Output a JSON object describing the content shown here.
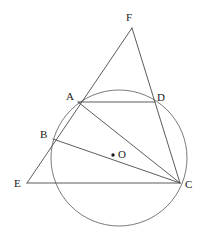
{
  "figure": {
    "type": "euclidean-geometry-diagram",
    "background_color": "#ffffff",
    "stroke_color": "#4a4a4a",
    "label_color": "#1a1a1a",
    "canvas": {
      "width": 201,
      "height": 238
    }
  },
  "circle": {
    "name": "circumscribed-circle",
    "center": {
      "x": 119,
      "y": 158
    },
    "radius": 68,
    "stroke": "#6b6b6b",
    "stroke_width": 0.9,
    "fill": "none"
  },
  "points": [
    {
      "id": "A",
      "label": "A",
      "x": 78,
      "y": 102,
      "label_x": 66,
      "label_y": 91,
      "on_circle": true,
      "dot": false
    },
    {
      "id": "B",
      "label": "B",
      "x": 53,
      "y": 139,
      "label_x": 40,
      "label_y": 129,
      "on_circle": true,
      "dot": false
    },
    {
      "id": "C",
      "label": "C",
      "x": 180,
      "y": 183,
      "label_x": 185,
      "label_y": 179,
      "on_circle": true,
      "dot": false
    },
    {
      "id": "D",
      "label": "D",
      "x": 155,
      "y": 102,
      "label_x": 157,
      "label_y": 92,
      "on_circle": true,
      "dot": false
    },
    {
      "id": "E",
      "label": "E",
      "x": 27,
      "y": 183,
      "label_x": 14,
      "label_y": 178,
      "on_circle": false,
      "dot": false
    },
    {
      "id": "F",
      "label": "F",
      "x": 132,
      "y": 28,
      "label_x": 126,
      "label_y": 12,
      "on_circle": false,
      "dot": false
    },
    {
      "id": "O",
      "label": "O",
      "x": 113,
      "y": 155,
      "label_x": 118,
      "label_y": 149,
      "on_circle": false,
      "dot": true
    }
  ],
  "segments": [
    {
      "name": "segment-E-F",
      "from": "E",
      "to": "F",
      "note": "secant through B and A extended to external point F"
    },
    {
      "name": "segment-F-C",
      "from": "F",
      "to": "C",
      "note": "secant through D extended to external point F"
    },
    {
      "name": "segment-E-C",
      "from": "E",
      "to": "C",
      "note": "horizontal base line through external point E"
    },
    {
      "name": "chord-A-D",
      "from": "A",
      "to": "D",
      "note": "chord"
    },
    {
      "name": "chord-A-C",
      "from": "A",
      "to": "C",
      "note": "chord / diagonal"
    },
    {
      "name": "chord-B-C",
      "from": "B",
      "to": "C",
      "note": "chord passing near center O"
    }
  ]
}
